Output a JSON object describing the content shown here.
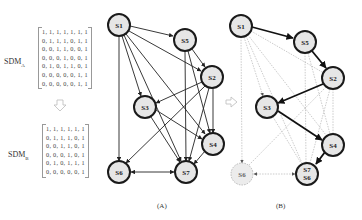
{
  "matrix_a": {
    "label": "SDM",
    "subscript": "A",
    "rows": [
      "1, 1, 1, 1, 1, 1, 1",
      "0, 1, 1, 1, 0, 1, 1",
      "0, 0, 1, 1, 0, 0, 1",
      "0, 0, 0, 1, 0, 0, 1",
      "0, 1, 0, 1, 1, 0, 1",
      "0, 0, 0, 0, 0, 1, 1",
      "0, 0, 0, 0, 0, 1, 1"
    ]
  },
  "matrix_b": {
    "label": "SDM",
    "subscript": "B",
    "rows": [
      "1, 1, 1, 1, 1, 1",
      "0, 1, 1, 1, 0, 1",
      "0, 0, 1, 1, 0, 1",
      "0, 0, 0, 1, 0, 1",
      "0, 1, 0, 1, 1, 1",
      "0, 0, 0, 0, 0, 1"
    ]
  },
  "graph_a": {
    "caption": "(A)",
    "nodes": [
      {
        "id": "S1",
        "label": "S1",
        "x": 119,
        "y": 25
      },
      {
        "id": "S5",
        "label": "S5",
        "x": 185,
        "y": 40
      },
      {
        "id": "S2",
        "label": "S2",
        "x": 212,
        "y": 77
      },
      {
        "id": "S3",
        "label": "S3",
        "x": 145,
        "y": 107
      },
      {
        "id": "S4",
        "label": "S4",
        "x": 213,
        "y": 144
      },
      {
        "id": "S6",
        "label": "S6",
        "x": 119,
        "y": 172
      },
      {
        "id": "S7",
        "label": "S7",
        "x": 186,
        "y": 172
      }
    ]
  },
  "graph_b": {
    "caption": "(B)",
    "nodes": [
      {
        "id": "S1",
        "label": "S1",
        "x": 241,
        "y": 26
      },
      {
        "id": "S5",
        "label": "S5",
        "x": 305,
        "y": 42
      },
      {
        "id": "S2",
        "label": "S2",
        "x": 333,
        "y": 78
      },
      {
        "id": "S3",
        "label": "S3",
        "x": 267,
        "y": 107
      },
      {
        "id": "S4",
        "label": "S4",
        "x": 333,
        "y": 145
      },
      {
        "id": "S6",
        "label": "S6",
        "x": 242,
        "y": 174,
        "style": "dashed"
      },
      {
        "id": "S7S6",
        "label": "S7",
        "label2": "S6",
        "x": 307,
        "y": 174
      }
    ]
  },
  "colors": {
    "node_fill": "#e6e6e6",
    "node_stroke": "#1a1a1a",
    "edge": "#222222",
    "faded_edge": "#b5b5b5",
    "arrow_hollow": "#bbbbbb"
  }
}
